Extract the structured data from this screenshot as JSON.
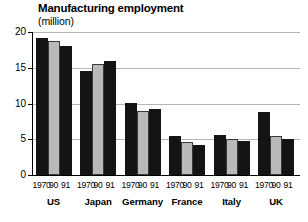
{
  "chart_data": {
    "type": "bar",
    "title": "Manufacturing employment",
    "subtitle": "(million)",
    "xlabel": "",
    "ylabel": "",
    "unit": "million",
    "ylim": [
      0,
      20
    ],
    "yticks": [
      0,
      5,
      10,
      15,
      20
    ],
    "ytick_labels": [
      "0",
      "5",
      "10",
      "15",
      "20"
    ],
    "grid": true,
    "legend": "none",
    "categories": [
      "US",
      "Japan",
      "Germany",
      "France",
      "Italy",
      "UK"
    ],
    "series_names": [
      "1970",
      "90",
      "91"
    ],
    "series": [
      {
        "name": "1970",
        "color": "#141414",
        "values": [
          19.1,
          14.5,
          10.1,
          5.5,
          5.6,
          8.8
        ]
      },
      {
        "name": "90",
        "color": "#b9b9b9",
        "values": [
          18.7,
          15.5,
          9.0,
          4.6,
          5.1,
          5.5
        ]
      },
      {
        "name": "91",
        "color": "#141414",
        "values": [
          18.0,
          16.0,
          9.2,
          4.2,
          4.8,
          5.1
        ]
      }
    ],
    "groups": [
      {
        "label": "US",
        "bars": [
          {
            "year": "1970",
            "value": 19.1,
            "style": "dark"
          },
          {
            "year": "90",
            "value": 18.7,
            "style": "light"
          },
          {
            "year": "91",
            "value": 18.0,
            "style": "dark"
          }
        ]
      },
      {
        "label": "Japan",
        "bars": [
          {
            "year": "1970",
            "value": 14.5,
            "style": "dark"
          },
          {
            "year": "90",
            "value": 15.5,
            "style": "light"
          },
          {
            "year": "91",
            "value": 16.0,
            "style": "dark"
          }
        ]
      },
      {
        "label": "Germany",
        "bars": [
          {
            "year": "1970",
            "value": 10.1,
            "style": "dark"
          },
          {
            "year": "90",
            "value": 9.0,
            "style": "light"
          },
          {
            "year": "91",
            "value": 9.2,
            "style": "dark"
          }
        ]
      },
      {
        "label": "France",
        "bars": [
          {
            "year": "1970",
            "value": 5.5,
            "style": "dark"
          },
          {
            "year": "90",
            "value": 4.6,
            "style": "light"
          },
          {
            "year": "91",
            "value": 4.2,
            "style": "dark"
          }
        ]
      },
      {
        "label": "Italy",
        "bars": [
          {
            "year": "1970",
            "value": 5.6,
            "style": "dark"
          },
          {
            "year": "90",
            "value": 5.1,
            "style": "light"
          },
          {
            "year": "91",
            "value": 4.8,
            "style": "dark"
          }
        ]
      },
      {
        "label": "UK",
        "bars": [
          {
            "year": "1970",
            "value": 8.8,
            "style": "dark"
          },
          {
            "year": "90",
            "value": 5.5,
            "style": "light"
          },
          {
            "year": "91",
            "value": 5.1,
            "style": "dark"
          }
        ]
      }
    ],
    "colors": {
      "dark_bar": "#141414",
      "light_bar": "#b9b9b9",
      "bar_outline": "#3a3a3a",
      "gridline": "#b5b5b5",
      "axis": "#000000",
      "background": "#ffffff"
    }
  }
}
